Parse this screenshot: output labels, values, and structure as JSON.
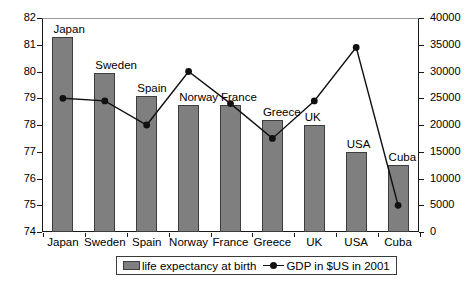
{
  "chart_data": {
    "type": "bar",
    "title": "",
    "subtitle": "",
    "xlabel": "",
    "ylabel": "",
    "categories": [
      "Japan",
      "Sweden",
      "Spain",
      "Norway",
      "France",
      "Greece",
      "UK",
      "USA",
      "Cuba"
    ],
    "grid": false,
    "legend_position": "bottom",
    "axes": {
      "left": {
        "label": "life expectancy at birth",
        "min": 74,
        "max": 82,
        "step": 1,
        "ticks": [
          "74",
          "75",
          "76",
          "77",
          "78",
          "79",
          "80",
          "81",
          "82"
        ],
        "tick_values": [
          74,
          75,
          76,
          77,
          78,
          79,
          80,
          81,
          82
        ]
      },
      "right": {
        "label": "GDP in $US in 2001",
        "min": 0,
        "max": 40000,
        "step": 5000,
        "ticks": [
          "0",
          "5000",
          "10000",
          "15000",
          "20000",
          "25000",
          "30000",
          "35000",
          "40000"
        ],
        "tick_values": [
          0,
          5000,
          10000,
          15000,
          20000,
          25000,
          30000,
          35000,
          40000
        ]
      }
    },
    "series": [
      {
        "name": "life expectancy at birth",
        "type": "bar",
        "axis": "left",
        "color": "#7f7f7f",
        "values": [
          81.3,
          79.95,
          79.1,
          78.75,
          78.75,
          78.2,
          78.0,
          77.0,
          76.5
        ]
      },
      {
        "name": "GDP in $US in 2001",
        "type": "line",
        "axis": "right",
        "color": "#111111",
        "values": [
          25000,
          24500,
          20000,
          30000,
          24000,
          17500,
          24500,
          34500,
          5000
        ]
      }
    ],
    "annotations": [
      {
        "text": "Japan",
        "for": "Japan"
      },
      {
        "text": "Sweden",
        "for": "Sweden"
      },
      {
        "text": "Spain",
        "for": "Spain"
      },
      {
        "text": "Norway",
        "for": "Norway"
      },
      {
        "text": "France",
        "for": "France"
      },
      {
        "text": "Greece",
        "for": "Greece"
      },
      {
        "text": "UK",
        "for": "UK"
      },
      {
        "text": "USA",
        "for": "USA"
      },
      {
        "text": "Cuba",
        "for": "Cuba"
      }
    ]
  },
  "legend": {
    "items": [
      {
        "label": "life expectancy at birth",
        "marker": "bar-swatch"
      },
      {
        "label": "GDP in $US in 2001",
        "marker": "line-marker"
      }
    ]
  },
  "colors": {
    "bar_fill": "#7f7f7f",
    "bar_stroke": "#3d3d3d",
    "line": "#111111",
    "axis": "#1a1a1a",
    "background": "#ffffff"
  }
}
